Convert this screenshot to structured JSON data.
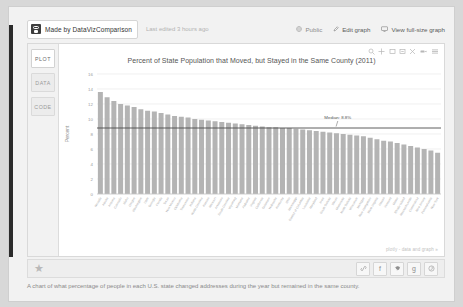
{
  "header": {
    "owner_avatar": "user-avatar-icon",
    "made_by_label": "Made by DataVizComparison",
    "last_edited": "Last edited 3 hours ago",
    "actions": [
      {
        "name": "public",
        "label": "Public",
        "icon": "globe-icon"
      },
      {
        "name": "edit-graph",
        "label": "Edit graph",
        "icon": "pencil-icon"
      },
      {
        "name": "view-full-size",
        "label": "View full-size graph",
        "icon": "monitor-icon"
      }
    ]
  },
  "tabs": [
    {
      "name": "plot",
      "label": "PLOT",
      "active": true
    },
    {
      "name": "data",
      "label": "DATA",
      "active": false
    },
    {
      "name": "code",
      "label": "CODE",
      "active": false
    }
  ],
  "modebar": [
    {
      "name": "zoom",
      "icon": "magnifier-icon"
    },
    {
      "name": "pan",
      "icon": "crosshair-icon"
    },
    {
      "name": "zoom-in-box",
      "icon": "zoom-box-icon"
    },
    {
      "name": "zoom-out-box",
      "icon": "zoom-out-box-icon"
    },
    {
      "name": "autoscale",
      "icon": "autoscale-icon"
    },
    {
      "name": "hover-closest",
      "icon": "hover-closest-icon"
    },
    {
      "name": "hover-compare",
      "icon": "hover-compare-icon"
    }
  ],
  "plotly_credit": "plotly - data and graph »",
  "sharebar": {
    "star_icon": "star-icon",
    "social": [
      {
        "name": "link",
        "glyph": "✒"
      },
      {
        "name": "facebook",
        "glyph": "f"
      },
      {
        "name": "twitter",
        "glyph": "✉"
      },
      {
        "name": "google-plus",
        "glyph": "g"
      },
      {
        "name": "pinterest",
        "glyph": "Ⓟ"
      }
    ]
  },
  "caption": "A chart of what percentage of people in each U.S. state changed addresses during the year but remained in the same county.",
  "chart_data": {
    "type": "bar",
    "title": "Percent of State Population that Moved, but Stayed in the Same County (2011)",
    "xlabel": "",
    "ylabel": "Percent",
    "ylim": [
      0,
      16
    ],
    "yticks": [
      0,
      2,
      4,
      6,
      8,
      10,
      12,
      14,
      16
    ],
    "ytick_labels": [
      "0",
      "2",
      "4",
      "6",
      "8",
      "10",
      "12",
      "14",
      "16"
    ],
    "grid": true,
    "legend": "none",
    "bar_color": "#b4b4b4",
    "annotation": {
      "text": "Median: 8.8%",
      "value": 8.8,
      "line_color": "#4d4d4d"
    },
    "categories": [
      "Nevada",
      "Alaska",
      "Arizona",
      "Colorado",
      "Idaho",
      "Oregon",
      "Washington",
      "Utah",
      "Georgia",
      "Florida",
      "Texas",
      "New Mexico",
      "Oklahoma",
      "Tennessee",
      "Indiana",
      "North Carolina",
      "Kansas",
      "Missouri",
      "Arkansas",
      "South Carolina",
      "Wyoming",
      "Montana",
      "Alabama",
      "Virginia",
      "California",
      "Delaware",
      "Nebraska",
      "Kentucky",
      "Ohio",
      "Mississippi",
      "District of Columbia",
      "Louisiana",
      "Maryland",
      "Iowa",
      "South Dakota",
      "Illinois",
      "Minnesota",
      "North Dakota",
      "Wisconsin",
      "Michigan",
      "New Hampshire",
      "West Virginia",
      "Hawaii",
      "Vermont",
      "Maine",
      "Rhode Island",
      "Massachusetts",
      "Connecticut",
      "New Jersey",
      "Pennsylvania",
      "New York"
    ],
    "values": [
      13.6,
      12.9,
      12.4,
      12.0,
      11.8,
      11.6,
      11.3,
      11.1,
      11.0,
      10.8,
      10.6,
      10.4,
      10.3,
      10.2,
      10.0,
      9.9,
      9.8,
      9.7,
      9.6,
      9.5,
      9.4,
      9.3,
      9.2,
      9.1,
      9.0,
      8.9,
      8.9,
      8.8,
      8.8,
      8.7,
      8.6,
      8.5,
      8.4,
      8.3,
      8.2,
      8.1,
      8.0,
      7.9,
      7.8,
      7.7,
      7.5,
      7.3,
      7.1,
      7.0,
      6.8,
      6.6,
      6.4,
      6.2,
      6.0,
      5.8,
      5.5
    ]
  }
}
